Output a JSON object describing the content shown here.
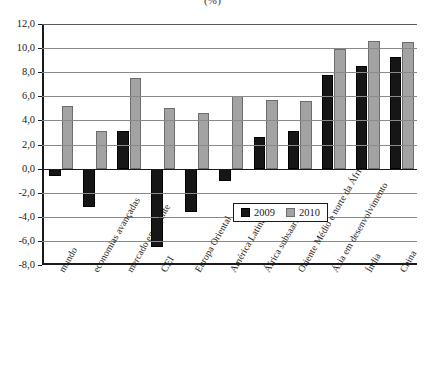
{
  "chart_data": {
    "type": "bar",
    "title": "(%)",
    "xlabel": "",
    "ylabel": "",
    "ylim": [
      -8.0,
      12.0
    ],
    "ytick_step": 2.0,
    "grid": true,
    "legend_position": "inside bottom-right",
    "categories": [
      "mundo",
      "economias avançadas",
      "mercado emergente",
      "CEI",
      "Europa Oriental",
      "América Latina",
      "África subsaariana",
      "Oriente Médio e norte da África",
      "Ásia em desenvolvimento",
      "Índia",
      "China"
    ],
    "ytick_labels": [
      "12,0",
      "10,0",
      "8,0",
      "6,0",
      "4,0",
      "2,0",
      "0,0",
      "-2,0",
      "-4,0",
      "-6,0",
      "-8,0"
    ],
    "ytick_values": [
      12,
      10,
      8,
      6,
      4,
      2,
      0,
      -2,
      -4,
      -6,
      -8
    ],
    "series": [
      {
        "name": "2009",
        "color": "#161616",
        "values": [
          -0.6,
          -3.2,
          3.1,
          -6.5,
          -3.6,
          -1.0,
          2.6,
          3.1,
          7.8,
          8.5,
          9.3
        ]
      },
      {
        "name": "2010",
        "color": "#a3a3a3",
        "values": [
          5.2,
          3.1,
          7.5,
          5.0,
          4.6,
          6.0,
          5.7,
          5.6,
          9.9,
          10.6,
          10.5
        ]
      }
    ]
  },
  "legend": {
    "items": [
      {
        "label": "2009",
        "color": "#161616"
      },
      {
        "label": "2010",
        "color": "#a3a3a3"
      }
    ]
  }
}
